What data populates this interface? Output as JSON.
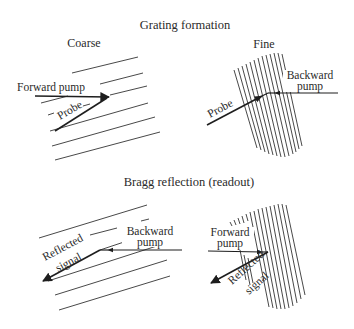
{
  "sections": {
    "formation": {
      "title": "Grating formation",
      "coarse": {
        "label": "Coarse",
        "beams": {
          "forward_pump": "Forward pump",
          "probe": "Probe"
        }
      },
      "fine": {
        "label": "Fine",
        "beams": {
          "backward_pump_line1": "Backward",
          "backward_pump_line2": "pump",
          "probe": "Probe"
        }
      }
    },
    "readout": {
      "title": "Bragg reflection (readout)",
      "coarse": {
        "beams": {
          "reflected_line1": "Reflected",
          "reflected_line2": "signal",
          "backward_pump_line1": "Backward",
          "backward_pump_line2": "pump"
        }
      },
      "fine": {
        "beams": {
          "forward_pump_line1": "Forward",
          "forward_pump_line2": "pump",
          "reflected_line1": "Reflected",
          "reflected_line2": "signal"
        }
      }
    }
  },
  "icons": {
    "arrowhead": "filled-triangle"
  },
  "colors": {
    "ink": "#1e1e1e",
    "background": "#ffffff"
  }
}
